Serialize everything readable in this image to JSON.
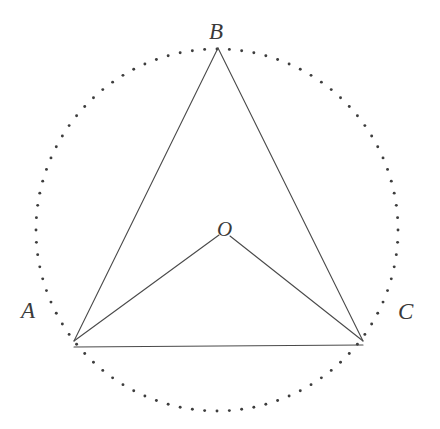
{
  "figure": {
    "background_color": "#ffffff",
    "stroke_color": "#4a4a4a",
    "dot_color": "#3d3d3d",
    "label_color": "#3a3a3a",
    "canvas": {
      "width": 440,
      "height": 429
    }
  },
  "circle": {
    "name": "circumcircle",
    "center": {
      "x": 217,
      "y": 230
    },
    "radius": 181,
    "style": "dotted",
    "dot_radius": 1.45,
    "dot_count": 92
  },
  "points": [
    {
      "id": "A",
      "label": "A",
      "x": 74,
      "y": 341,
      "label_x": 21,
      "label_y": 299
    },
    {
      "id": "B",
      "label": "B",
      "x": 218,
      "y": 48,
      "label_x": 209,
      "label_y": 20
    },
    {
      "id": "C",
      "label": "C",
      "x": 363,
      "y": 341,
      "label_x": 398,
      "label_y": 300
    },
    {
      "id": "O",
      "label": "O",
      "x": 224,
      "y": 236,
      "label_x": 217,
      "label_y": 219
    }
  ],
  "segments": [
    {
      "id": "AB",
      "from": "A",
      "to": "B",
      "x1": 74,
      "y1": 341,
      "x2": 218,
      "y2": 48
    },
    {
      "id": "BC",
      "from": "B",
      "to": "C",
      "x1": 218,
      "y1": 48,
      "x2": 363,
      "y2": 341
    },
    {
      "id": "AC",
      "from": "A",
      "to": "C",
      "x1": 74,
      "y1": 347,
      "x2": 363,
      "y2": 345
    },
    {
      "id": "AO",
      "from": "A",
      "to": "O",
      "x1": 74,
      "y1": 341,
      "x2": 219,
      "y2": 235
    },
    {
      "id": "OC",
      "from": "O",
      "to": "C",
      "x1": 230,
      "y1": 236,
      "x2": 363,
      "y2": 341
    }
  ],
  "labels": {
    "A": "A",
    "B": "B",
    "C": "C",
    "O": "O"
  }
}
